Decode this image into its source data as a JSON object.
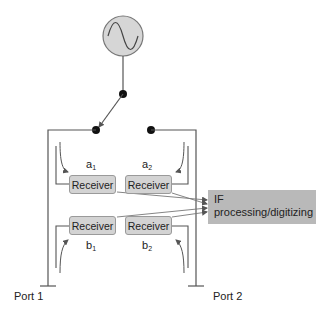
{
  "diagram": {
    "source": {
      "label": "signal-source",
      "icon": "sine-wave"
    },
    "receivers": [
      {
        "id": "a1",
        "label": "Receiver",
        "wave": "a",
        "sub": "1"
      },
      {
        "id": "a2",
        "label": "Receiver",
        "wave": "a",
        "sub": "2"
      },
      {
        "id": "b1",
        "label": "Receiver",
        "wave": "b",
        "sub": "1"
      },
      {
        "id": "b2",
        "label": "Receiver",
        "wave": "b",
        "sub": "2"
      }
    ],
    "if_block": {
      "line1": "IF",
      "line2": "processing/digitizing"
    },
    "ports": [
      {
        "label": "Port 1"
      },
      {
        "label": "Port 2"
      }
    ],
    "colors": {
      "line": "#555555",
      "receiver_fill": "#d3d3d3",
      "if_fill": "#b9b9b9",
      "source_fill": "#d6d6d6"
    }
  }
}
